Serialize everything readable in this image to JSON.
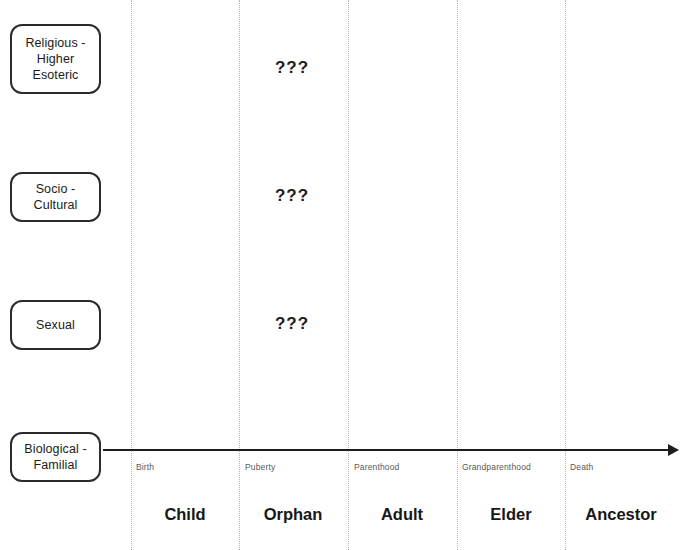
{
  "diagram": {
    "dimensions": [
      {
        "id": "religious",
        "label": "Religious -\nHigher\nEsoteric"
      },
      {
        "id": "socio",
        "label": "Socio -\nCultural"
      },
      {
        "id": "sexual",
        "label": "Sexual"
      },
      {
        "id": "biological",
        "label": "Biological -\nFamilial"
      }
    ],
    "axis": {
      "orientation": "horizontal",
      "arrow": "right",
      "color": "#1d1d1d"
    },
    "events": [
      {
        "label": "Birth",
        "x": 136
      },
      {
        "label": "Puberty",
        "x": 245
      },
      {
        "label": "Parenthood",
        "x": 354
      },
      {
        "label": "Grandparenthood",
        "x": 462
      },
      {
        "label": "Death",
        "x": 570
      }
    ],
    "stages": [
      {
        "label": "Child",
        "center": 185
      },
      {
        "label": "Orphan",
        "center": 293
      },
      {
        "label": "Adult",
        "center": 402
      },
      {
        "label": "Elder",
        "center": 511
      },
      {
        "label": "Ancestor",
        "center": 621
      }
    ],
    "gridlines": [
      131,
      239,
      348,
      457,
      565
    ],
    "unknown_markers": [
      {
        "text": "???",
        "row": "religious",
        "y": 68
      },
      {
        "text": "???",
        "row": "socio",
        "y": 196
      },
      {
        "text": "???",
        "row": "sexual",
        "y": 324
      }
    ],
    "colors": {
      "background": "#ffffff",
      "box_border": "#2b2b2b",
      "axis": "#1d1d1d",
      "gridline": "#b9b9b9",
      "event_text": "#5a5a5a",
      "stage_text": "#171717"
    }
  },
  "chart_data": {
    "type": "table",
    "title": "",
    "xlabel": "",
    "ylabel": "",
    "categories": [
      "Child",
      "Orphan",
      "Adult",
      "Elder",
      "Ancestor"
    ],
    "tick_labels": [
      "Birth",
      "Puberty",
      "Parenthood",
      "Grandparenthood",
      "Death"
    ],
    "row_labels": [
      "Religious - Higher Esoteric",
      "Socio - Cultural",
      "Sexual",
      "Biological - Familial"
    ],
    "annotations": [
      "???",
      "???",
      "???"
    ],
    "grid": true,
    "legend": "none"
  }
}
